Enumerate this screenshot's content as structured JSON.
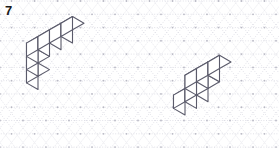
{
  "page": {
    "label": "7",
    "width": 279,
    "height": 148,
    "background_color": "#ffffff"
  },
  "grid": {
    "type": "isometric-triangular-dotted",
    "dot_color": "#b9b9c4",
    "line_color": "#d4d4de",
    "line_style": "dotted",
    "cell_width": 23.0,
    "cell_height": 13.28,
    "origin_x": -11.5,
    "origin_y": 1.0,
    "columns": 14,
    "rows": 13
  },
  "figures": [
    {
      "name": "left-solid",
      "description": "L-shaped solid: vertical stack of three cubes with a horizontal run of three cubes extending up-right from the top cube",
      "stroke_color": "#5b5b6b",
      "stroke_width": 1.1,
      "face_color": "#ffffff",
      "origin_x": 38.0,
      "origin_y": 89.5,
      "unit_x": 23.0,
      "unit_y": 13.28,
      "unit_z": 26.5,
      "cubes": [
        {
          "x": 0,
          "y": 0,
          "z": 0
        },
        {
          "x": 0,
          "y": 0,
          "z": 1
        },
        {
          "x": 0,
          "y": 0,
          "z": 2
        },
        {
          "x": 1,
          "y": 0,
          "z": 2
        },
        {
          "x": 2,
          "y": 0,
          "z": 2
        },
        {
          "x": 3,
          "y": 0,
          "z": 2
        }
      ]
    },
    {
      "name": "right-solid",
      "description": "Stepped solid: lower row of two cubes with a gap and an upper row of two cubes forming a staircase",
      "stroke_color": "#5b5b6b",
      "stroke_width": 1.1,
      "face_color": "#ffffff",
      "origin_x": 185.0,
      "origin_y": 115.0,
      "unit_x": 23.0,
      "unit_y": 13.28,
      "unit_z": 26.5,
      "cubes": [
        {
          "x": 0,
          "y": 0,
          "z": 0
        },
        {
          "x": 1,
          "y": 0,
          "z": 0
        },
        {
          "x": 2,
          "y": 0,
          "z": 0
        },
        {
          "x": 1,
          "y": 0,
          "z": 1
        },
        {
          "x": 2,
          "y": 0,
          "z": 1
        },
        {
          "x": 3,
          "y": 0,
          "z": 1
        }
      ]
    }
  ]
}
